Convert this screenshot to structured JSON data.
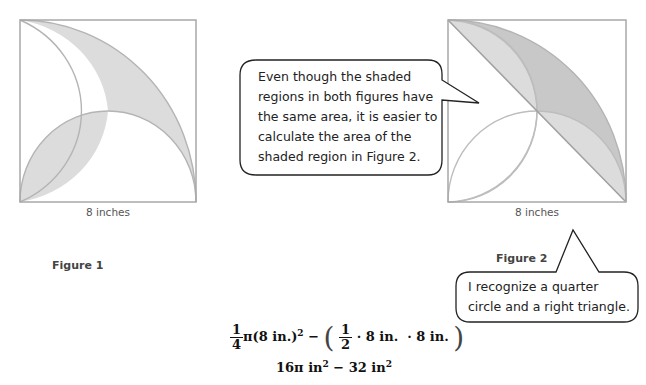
{
  "figures": [
    {
      "id": "figure-1",
      "caption": "Figure 1",
      "dimension_label": "8 inches",
      "side_length_inches": 8,
      "description": "Square with two quarter-circle arcs and a semicircle; shaded crescent and lens regions"
    },
    {
      "id": "figure-2",
      "caption": "Figure 2",
      "dimension_label": "8 inches",
      "side_length_inches": 8,
      "description": "Square with diagonal, quarter circle and semicircles; shaded region between diagonal and quarter-circle arc"
    }
  ],
  "callouts": [
    {
      "id": "callout-comparison",
      "lines": [
        "Even though the shaded",
        "regions in both figures have",
        "the same area, it is easier to",
        "calculate the area of the",
        "shaded region in Figure 2."
      ]
    },
    {
      "id": "callout-recognize",
      "lines": [
        "I recognize a quarter",
        "circle and a right triangle."
      ]
    }
  ],
  "formula": {
    "line1": {
      "frac1_num": "1",
      "frac1_den": "4",
      "pi_term": "π(8 in.)",
      "pi_exp": "2",
      "minus": " − ",
      "open_paren": "(",
      "frac2_num": "1",
      "frac2_den": "2",
      "product": "· 8 in.  · 8 in.",
      "close_paren": ")"
    },
    "line2": {
      "term1": "16π in",
      "exp1": "2",
      "minus": " − 32 in",
      "exp2": "2"
    }
  },
  "colors": {
    "square_stroke": "#a8a8a8",
    "arc_stroke": "#b4b4b4",
    "shade_light": "#dcdcdc",
    "shade_dark": "#c8c8c8",
    "bubble_stroke": "#222222"
  }
}
